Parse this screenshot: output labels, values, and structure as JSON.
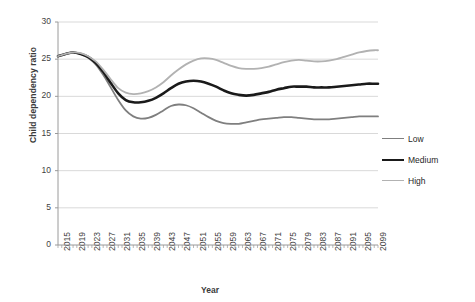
{
  "chart_data": {
    "type": "line",
    "title": "",
    "xlabel": "Year",
    "ylabel": "Child dependency ratio",
    "ylim": [
      0,
      30
    ],
    "yticks": [
      0,
      5,
      10,
      15,
      20,
      25,
      30
    ],
    "xlim": [
      2015,
      2100
    ],
    "grid": true,
    "legend_position": "right",
    "xtick_labels": [
      "2015",
      "2019",
      "2023",
      "2027",
      "2031",
      "2035",
      "2039",
      "2043",
      "2047",
      "2051",
      "2055",
      "2059",
      "2063",
      "2067",
      "2071",
      "2075",
      "2079",
      "2083",
      "2087",
      "2091",
      "2095",
      "2099"
    ],
    "x": [
      2015,
      2017,
      2019,
      2021,
      2023,
      2025,
      2027,
      2029,
      2031,
      2033,
      2035,
      2037,
      2039,
      2041,
      2043,
      2045,
      2047,
      2049,
      2051,
      2053,
      2055,
      2057,
      2059,
      2061,
      2063,
      2065,
      2067,
      2069,
      2071,
      2073,
      2075,
      2077,
      2079,
      2081,
      2083,
      2085,
      2087,
      2089,
      2091,
      2093,
      2095,
      2097,
      2099,
      2100
    ],
    "series": [
      {
        "name": "Low",
        "color": "#7f7f7f",
        "width": 1.8,
        "values": [
          25.4,
          25.7,
          25.9,
          25.7,
          25.2,
          24.3,
          22.9,
          21.2,
          19.5,
          18.1,
          17.3,
          17.0,
          17.1,
          17.5,
          18.1,
          18.7,
          18.9,
          18.8,
          18.4,
          17.8,
          17.2,
          16.7,
          16.4,
          16.3,
          16.3,
          16.5,
          16.7,
          16.9,
          17.0,
          17.1,
          17.2,
          17.2,
          17.1,
          17.0,
          16.9,
          16.9,
          16.9,
          17.0,
          17.1,
          17.2,
          17.3,
          17.3,
          17.3,
          17.3
        ]
      },
      {
        "name": "Medium",
        "color": "#1a1a1a",
        "width": 2.6,
        "values": [
          25.4,
          25.7,
          25.9,
          25.7,
          25.3,
          24.5,
          23.3,
          21.8,
          20.4,
          19.5,
          19.2,
          19.2,
          19.4,
          19.8,
          20.4,
          21.1,
          21.7,
          22.0,
          22.1,
          22.0,
          21.7,
          21.3,
          20.8,
          20.4,
          20.2,
          20.1,
          20.2,
          20.4,
          20.6,
          20.9,
          21.1,
          21.3,
          21.3,
          21.3,
          21.2,
          21.2,
          21.2,
          21.3,
          21.4,
          21.5,
          21.6,
          21.7,
          21.7,
          21.7
        ]
      },
      {
        "name": "High",
        "color": "#b2b2b2",
        "width": 1.8,
        "values": [
          25.4,
          25.7,
          25.9,
          25.8,
          25.4,
          24.7,
          23.6,
          22.3,
          21.1,
          20.5,
          20.3,
          20.4,
          20.7,
          21.2,
          21.9,
          22.8,
          23.6,
          24.3,
          24.8,
          25.1,
          25.1,
          24.9,
          24.5,
          24.1,
          23.8,
          23.7,
          23.7,
          23.8,
          24.0,
          24.3,
          24.6,
          24.8,
          24.9,
          24.8,
          24.7,
          24.7,
          24.8,
          25.0,
          25.3,
          25.6,
          25.9,
          26.1,
          26.2,
          26.2
        ]
      }
    ]
  }
}
